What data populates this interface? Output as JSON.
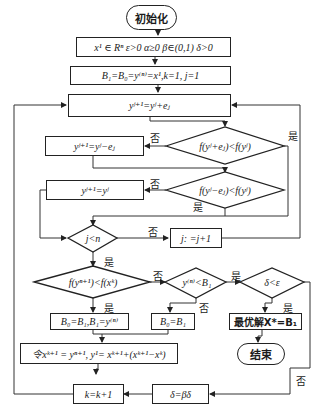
{
  "start": {
    "label": "初始化"
  },
  "init_params": {
    "label": "x¹ ∈ Rⁿ  ε>0  α≥0  β∈(0,1)  δ>0"
  },
  "init_vars": {
    "label": "B₁=B₀=y⁽ⁿ⁾=x¹,k=1, j=1"
  },
  "step_plus": {
    "label": "yʲ⁺¹=yʲ+eⱼ"
  },
  "cond_plus": {
    "label": "f(yʲ+eⱼ)<f(yʲ)"
  },
  "step_minus": {
    "label": "yʲ⁺¹=yʲ−eⱼ"
  },
  "cond_minus": {
    "label": "f(yʲ−eⱼ)<f(yʲ)"
  },
  "step_same": {
    "label": "yʲ⁺¹=yʲ"
  },
  "cond_j": {
    "label": "j<n"
  },
  "step_j_inc": {
    "label": "j:  =j+1"
  },
  "cond_f": {
    "label": "f(yⁿ⁺¹)<f(xᵏ)"
  },
  "cond_y": {
    "label": "y⁽ⁿ⁾<B₁"
  },
  "cond_delta": {
    "label": "δ<ε"
  },
  "assign_b_yes": {
    "label": "B₀=B₁,B₁=y⁽ⁿ⁾"
  },
  "assign_b_no": {
    "label": "B₀=B₁"
  },
  "optimal": {
    "label": "最优解X*=B₁"
  },
  "end": {
    "label": "结束"
  },
  "update_x": {
    "label": "令xᵏ⁺¹ = yⁿ⁺¹, y¹= xᵏ⁺¹+(xᵏ⁺¹−xᵏ)"
  },
  "step_k": {
    "label": "k=k+1"
  },
  "step_delta": {
    "label": "δ=βδ"
  },
  "edge_labels": {
    "yes": "是",
    "no": "否"
  }
}
